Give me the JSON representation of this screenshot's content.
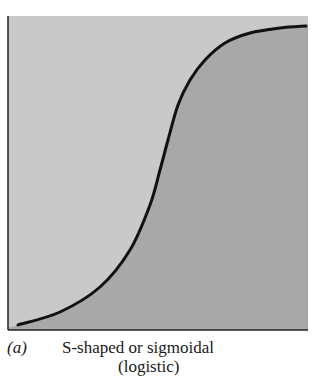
{
  "chart_data": {
    "type": "line",
    "title": "S-shaped or sigmoidal (logistic)",
    "xlabel": "",
    "ylabel": "",
    "grid": false,
    "legend": null,
    "curve_points_px": [
      [
        18,
        325
      ],
      [
        60,
        312
      ],
      [
        100,
        287
      ],
      [
        130,
        250
      ],
      [
        150,
        205
      ],
      [
        160,
        170
      ],
      [
        168,
        140
      ],
      [
        178,
        105
      ],
      [
        190,
        80
      ],
      [
        205,
        60
      ],
      [
        225,
        43
      ],
      [
        250,
        33
      ],
      [
        280,
        28
      ],
      [
        306,
        26
      ]
    ],
    "fill_below_color": "#a8a8a8",
    "fill_above_color": "#c8c8c8",
    "line_color": "#111111"
  },
  "caption": {
    "label": "(a)",
    "line1": "S-shaped or sigmoidal",
    "line2": "(logistic)"
  }
}
